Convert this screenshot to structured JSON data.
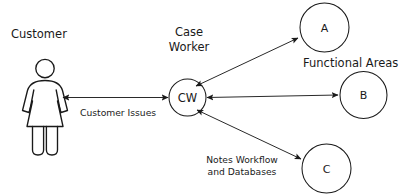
{
  "diagram": {
    "title_labels": {
      "customer": "Customer",
      "case_worker_line1": "Case",
      "case_worker_line2": "Worker",
      "functional_areas": "Functional Areas"
    },
    "edge_labels": {
      "customer_issues": "Customer Issues",
      "notes_line1": "Notes Workflow",
      "notes_line2": "and Databases"
    },
    "nodes": {
      "cw": "CW",
      "a": "A",
      "b": "B",
      "c": "C"
    },
    "colors": {
      "stroke": "#1a1a1a",
      "edge": "#2a2a2a",
      "background": "#ffffff"
    }
  }
}
